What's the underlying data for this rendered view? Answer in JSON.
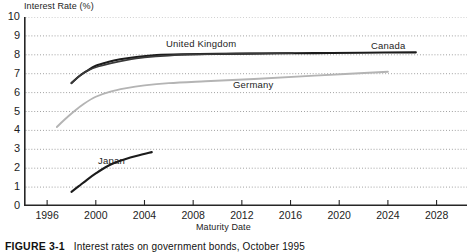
{
  "chart_data": {
    "type": "line",
    "title": "Interest rates on government bonds, October 1995",
    "figure_number": "FIGURE 3-1",
    "ylabel": "Interest Rate (%)",
    "xlabel": "Maturity Date",
    "xlim": [
      1994.1,
      2030.5
    ],
    "ylim": [
      0,
      10
    ],
    "yticks": [
      0,
      1,
      2,
      3,
      4,
      5,
      6,
      7,
      8,
      9,
      10
    ],
    "ytick_labels": [
      "0",
      "1",
      "2",
      "3",
      "4",
      "5",
      "6",
      "7",
      "8",
      "9",
      "10"
    ],
    "xticks": [
      1996,
      2000,
      2004,
      2008,
      2012,
      2016,
      2020,
      2024,
      2028
    ],
    "xtick_labels": [
      "1996",
      "2000",
      "2004",
      "2008",
      "2012",
      "2016",
      "2020",
      "2024",
      "2028"
    ],
    "grid": "horizontal-dotted",
    "legend": "inline-labels",
    "series": [
      {
        "name": "Canada",
        "color": "#1b1b1b",
        "width": 2.1,
        "label_pos": {
          "x": 2023.2,
          "y": 8.75
        },
        "points": [
          {
            "x": 1998.0,
            "y": 6.5
          },
          {
            "x": 1998.6,
            "y": 6.85
          },
          {
            "x": 1999.2,
            "y": 7.12
          },
          {
            "x": 2000.0,
            "y": 7.42
          },
          {
            "x": 2001.0,
            "y": 7.62
          },
          {
            "x": 2002.0,
            "y": 7.76
          },
          {
            "x": 2003.5,
            "y": 7.9
          },
          {
            "x": 2005.0,
            "y": 7.99
          },
          {
            "x": 2007.0,
            "y": 8.03
          },
          {
            "x": 2010.0,
            "y": 8.05
          },
          {
            "x": 2014.0,
            "y": 8.07
          },
          {
            "x": 2018.0,
            "y": 8.09
          },
          {
            "x": 2022.0,
            "y": 8.11
          },
          {
            "x": 2026.3,
            "y": 8.13
          }
        ]
      },
      {
        "name": "United Kingdom",
        "color": "#3a3a3a",
        "width": 1.7,
        "label_pos": {
          "x": 2004.8,
          "y": 8.72
        },
        "points": [
          {
            "x": 1998.0,
            "y": 6.5
          },
          {
            "x": 1998.7,
            "y": 6.9
          },
          {
            "x": 1999.4,
            "y": 7.18
          },
          {
            "x": 2000.2,
            "y": 7.38
          },
          {
            "x": 2001.2,
            "y": 7.55
          },
          {
            "x": 2002.5,
            "y": 7.72
          },
          {
            "x": 2004.0,
            "y": 7.86
          },
          {
            "x": 2006.0,
            "y": 7.96
          },
          {
            "x": 2008.5,
            "y": 8.02
          },
          {
            "x": 2011.5,
            "y": 8.06
          },
          {
            "x": 2016.2,
            "y": 8.1
          }
        ]
      },
      {
        "name": "Germany",
        "color": "#b4b4b4",
        "width": 1.9,
        "label_pos": {
          "x": 2012.6,
          "y": 6.55
        },
        "points": [
          {
            "x": 1996.8,
            "y": 4.18
          },
          {
            "x": 1997.4,
            "y": 4.55
          },
          {
            "x": 1998.2,
            "y": 5.0
          },
          {
            "x": 1999.0,
            "y": 5.4
          },
          {
            "x": 2000.0,
            "y": 5.78
          },
          {
            "x": 2001.2,
            "y": 6.05
          },
          {
            "x": 2002.4,
            "y": 6.22
          },
          {
            "x": 2004.0,
            "y": 6.38
          },
          {
            "x": 2006.0,
            "y": 6.5
          },
          {
            "x": 2009.0,
            "y": 6.6
          },
          {
            "x": 2013.0,
            "y": 6.72
          },
          {
            "x": 2018.0,
            "y": 6.9
          },
          {
            "x": 2024.0,
            "y": 7.1
          }
        ]
      },
      {
        "name": "Japan",
        "color": "#1b1b1b",
        "width": 2.1,
        "label_pos": {
          "x": 2000.4,
          "y": 2.78
        },
        "points": [
          {
            "x": 1998.0,
            "y": 0.75
          },
          {
            "x": 1998.6,
            "y": 1.05
          },
          {
            "x": 1999.3,
            "y": 1.4
          },
          {
            "x": 2000.0,
            "y": 1.72
          },
          {
            "x": 2000.8,
            "y": 2.05
          },
          {
            "x": 2001.6,
            "y": 2.3
          },
          {
            "x": 2002.4,
            "y": 2.48
          },
          {
            "x": 2003.4,
            "y": 2.66
          },
          {
            "x": 2004.6,
            "y": 2.85
          }
        ]
      }
    ]
  },
  "caption": {
    "figure_number": "FIGURE 3-1",
    "text": "Interest rates on government bonds, October 1995"
  }
}
